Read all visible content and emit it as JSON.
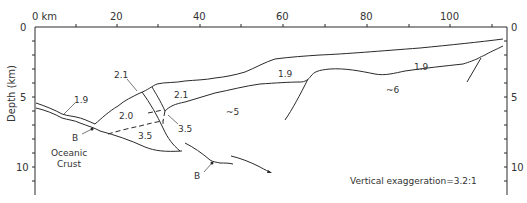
{
  "figure": {
    "type": "geologic cross-section",
    "x_axis": {
      "unit_label": "0 km",
      "ticks": [
        "20",
        "40",
        "60",
        "80",
        "100"
      ]
    },
    "y_axis": {
      "label": "Depth (km)",
      "left_ticks": [
        "0",
        "5",
        "10"
      ],
      "right_ticks": [
        "0",
        "5",
        "10"
      ]
    },
    "velocity_labels": {
      "v1": "1.9",
      "v2": "2.1",
      "v3": "2.1",
      "v4": "2.0",
      "v5": "3.5",
      "v6": "3.5",
      "v7": "~5",
      "v8": "1.9",
      "v9": "1.9",
      "v10": "~6"
    },
    "annotations": {
      "b1": "B",
      "b2": "B",
      "oceanic_line1": "Oceanic",
      "oceanic_line2": "Crust",
      "exaggeration": "Vertical exaggeration=3.2:1"
    }
  }
}
